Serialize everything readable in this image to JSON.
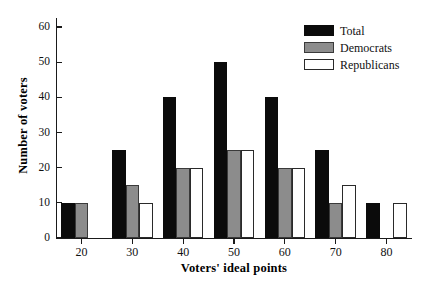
{
  "chart_data": {
    "type": "bar",
    "title": "",
    "subtitle": "",
    "xlabel": "Voters' ideal points",
    "ylabel": "Number of voters",
    "categories": [
      "20",
      "30",
      "40",
      "50",
      "60",
      "70",
      "80"
    ],
    "series": [
      {
        "name": "Total",
        "color": "#0b0b0b",
        "values": [
          10,
          25,
          40,
          50,
          40,
          25,
          10
        ]
      },
      {
        "name": "Democrats",
        "color": "#8c8c8c",
        "values": [
          10,
          15,
          20,
          25,
          20,
          10,
          0
        ]
      },
      {
        "name": "Republicans",
        "color": "#ffffff",
        "values": [
          0,
          10,
          20,
          25,
          20,
          15,
          10
        ]
      }
    ],
    "ylim": [
      0,
      62
    ],
    "yticks": [
      0,
      10,
      20,
      30,
      40,
      50,
      60
    ],
    "ytick_labels": [
      "0",
      "10",
      "20",
      "30",
      "40",
      "50",
      "60"
    ],
    "xtick_labels": [
      "20",
      "30",
      "40",
      "50",
      "60",
      "70",
      "80"
    ],
    "grid": false,
    "legend_position": "top-right",
    "legend": [
      "Total",
      "Democrats",
      "Republicans"
    ]
  },
  "legend": {
    "entries": [
      {
        "label": "Total",
        "swatch": "total"
      },
      {
        "label": "Democrats",
        "swatch": "dem"
      },
      {
        "label": "Republicans",
        "swatch": "rep"
      }
    ]
  },
  "axes": {
    "x_title": "Voters' ideal points",
    "y_title": "Number of voters"
  }
}
